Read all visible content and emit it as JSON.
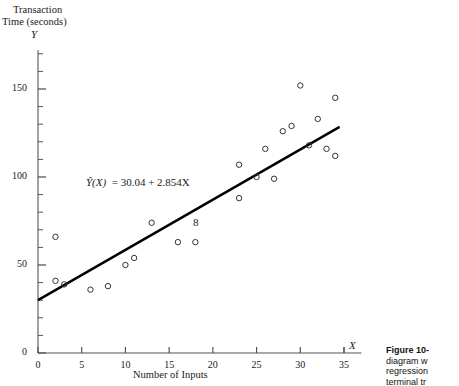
{
  "axes": {
    "y_title_line1": "Transaction",
    "y_title_line2": "Time (seconds)",
    "y_symbol": "Y",
    "x_symbol": "X",
    "x_title": "Number of Inputs",
    "y_ticks": [
      "0",
      "50",
      "100",
      "150"
    ],
    "x_ticks": [
      "0",
      "5",
      "10",
      "15",
      "20",
      "25",
      "30",
      "35"
    ]
  },
  "annotations": {
    "equation_lhs": "Ŷ(X)",
    "equation_rhs": "= 30.04 + 2.854X",
    "equation_full": "Ŷ(X) = 30.04 + 2.854X",
    "stray_mark": "8"
  },
  "caption": {
    "head": "Figure 10-",
    "line2": "diagram w",
    "line3": "regression",
    "line4": "terminal tr"
  },
  "colors": {
    "ink": "#1a1a1a",
    "axis": "#555555",
    "marker": "#333333",
    "line": "#000000"
  },
  "chart_data": {
    "type": "scatter",
    "title": "",
    "xlabel": "Number of Inputs",
    "ylabel": "Transaction Time (seconds)",
    "xlim": [
      0,
      37
    ],
    "ylim": [
      0,
      172
    ],
    "grid": false,
    "legend": null,
    "marker_style": "open-circle",
    "x": [
      2,
      2,
      3,
      6,
      8,
      10,
      11,
      13,
      16,
      18,
      23,
      23,
      25,
      26,
      27,
      28,
      29,
      30,
      31,
      32,
      33,
      34,
      34
    ],
    "y": [
      66,
      41,
      39,
      36,
      38,
      50,
      54,
      74,
      63,
      63,
      88,
      107,
      100,
      116,
      99,
      126,
      129,
      152,
      118,
      133,
      116,
      112,
      145
    ],
    "fit_line": {
      "label": "Ŷ(X) = 30.04 + 2.854X",
      "intercept": 30.04,
      "slope": 2.854,
      "x_start": 0,
      "x_end": 34.5
    }
  }
}
